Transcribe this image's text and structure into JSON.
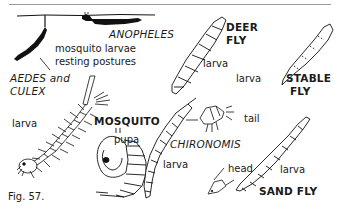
{
  "figure": {
    "caption": "Fig. 57.",
    "labels": {
      "anopheles": "ANOPHELES",
      "resting_line1": "mosquito larvae",
      "resting_line2": "resting postures",
      "aedes_line1": "AEDES and",
      "aedes_line2": "CULEX",
      "mosquito_larva": "larva",
      "mosquito": "MOSQUITO",
      "pupa": "pupa",
      "deer_fly_line1": "DEER",
      "deer_fly_line2": "FLY",
      "deer_fly_larva": "larva",
      "stable_fly_larva": "larva",
      "stable_fly_line1": "STABLE",
      "stable_fly_line2": "FLY",
      "chironomis": "CHIRONOMIS",
      "chironomis_larva": "larva",
      "tail": "tail",
      "head": "head",
      "sand_fly_larva": "larva",
      "sand_fly": "SAND FLY"
    }
  }
}
